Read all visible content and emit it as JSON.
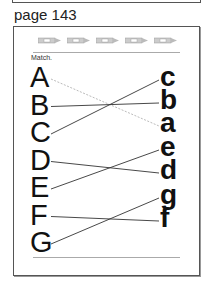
{
  "page_label": "page 143",
  "instruction": "Match.",
  "pencil_count": 5,
  "uppercase": [
    "A",
    "B",
    "C",
    "D",
    "E",
    "F",
    "G"
  ],
  "lowercase": [
    "c",
    "b",
    "a",
    "e",
    "d",
    "g",
    "f"
  ],
  "matches": [
    {
      "from": "A",
      "to": "a",
      "style": "dashed"
    },
    {
      "from": "B",
      "to": "b",
      "style": "solid"
    },
    {
      "from": "C",
      "to": "c",
      "style": "solid"
    },
    {
      "from": "D",
      "to": "d",
      "style": "solid"
    },
    {
      "from": "E",
      "to": "e",
      "style": "solid"
    },
    {
      "from": "F",
      "to": "f",
      "style": "solid"
    },
    {
      "from": "G",
      "to": "g",
      "style": "solid"
    }
  ],
  "colors": {
    "line": "#333333",
    "dashed_line": "#aaaaaa",
    "border": "#555555"
  }
}
